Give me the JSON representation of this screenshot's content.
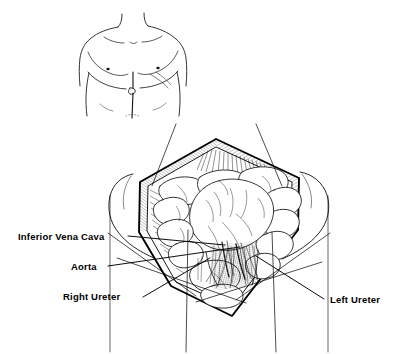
{
  "figure": {
    "style": {
      "background": "#ffffff",
      "ink": "#000000",
      "line_weight": "thin pen-and-ink hatching"
    }
  },
  "torso_inset": {
    "name": "male-torso-with-incision-line",
    "parts": [
      "neck",
      "left-shoulder",
      "right-shoulder",
      "chest",
      "left-nipple",
      "right-nipple",
      "costal-margin",
      "umbilicus",
      "midline-incision-line",
      "left-flank",
      "right-flank"
    ]
  },
  "main_illustration": {
    "name": "opened-abdominal-cavity",
    "shape": "diamond",
    "parts": [
      "upper-wound-edge-left",
      "upper-wound-edge-right",
      "lower-wound-edge-left",
      "lower-wound-edge-right",
      "retracted-abdominal-wall-flap-left",
      "retracted-abdominal-wall-flap-right",
      "cut-fascia-hatching",
      "small-bowel-loops",
      "large-bowel",
      "mesentery",
      "retroperitoneal-structures"
    ]
  },
  "labels": [
    {
      "id": "inferior-vena-cava",
      "text": "Inferior Vena Cava",
      "side": "left",
      "leader": "line from label to vessel in retroperitoneum"
    },
    {
      "id": "aorta",
      "text": "Aorta",
      "side": "left",
      "leader": "line from label to aorta in retroperitoneum"
    },
    {
      "id": "right-ureter",
      "text": "Right Ureter",
      "side": "left",
      "leader": "line from label crossing to right ureter"
    },
    {
      "id": "left-ureter",
      "text": "Left Ureter",
      "side": "right",
      "leader": "line from label crossing to left ureter"
    }
  ]
}
